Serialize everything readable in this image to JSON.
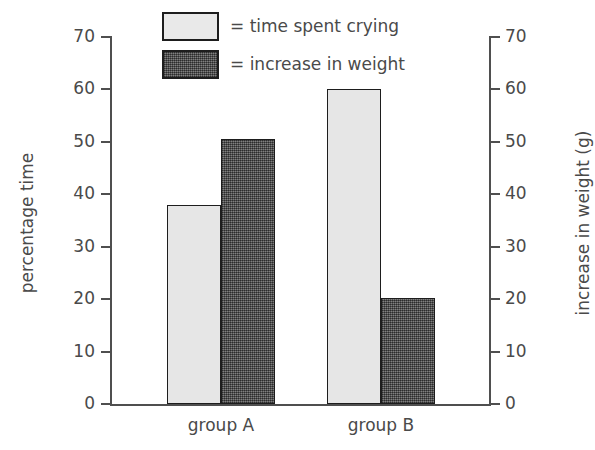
{
  "chart_data": {
    "type": "bar",
    "title": "",
    "categories": [
      "group A",
      "group B"
    ],
    "series": [
      {
        "name": "time spent crying",
        "legend_label": "= time spent crying",
        "axis": "left",
        "unit": "%",
        "color": "#e6e6e6",
        "fill_style": "light-solid",
        "values": [
          38,
          60
        ]
      },
      {
        "name": "increase in weight",
        "legend_label": "= increase in weight",
        "axis": "right",
        "unit": "g",
        "color": "#5a5a5a",
        "fill_style": "dark-stipple",
        "values": [
          50.5,
          20.3
        ]
      }
    ],
    "xlabel": "",
    "ylabel": "percentage time",
    "y2label": "increase in weight (g)",
    "ylim": [
      0,
      70
    ],
    "y2lim": [
      0,
      70
    ],
    "ytick_labels": [
      "0",
      "10",
      "20",
      "30",
      "40",
      "50",
      "60",
      "70"
    ],
    "ytick_values": [
      0,
      10,
      20,
      30,
      40,
      50,
      60,
      70
    ],
    "y2tick_labels": [
      "0",
      "10",
      "20",
      "30",
      "40",
      "50",
      "60",
      "70"
    ],
    "y2tick_values": [
      0,
      10,
      20,
      30,
      40,
      50,
      60,
      70
    ],
    "grid": false,
    "legend_position": "top-center"
  },
  "axes": {
    "left_title": "percentage time",
    "right_title": "increase in weight (g)"
  },
  "legend": {
    "items": [
      {
        "label": "= time spent crying"
      },
      {
        "label": "= increase in weight"
      }
    ]
  },
  "groups": [
    {
      "label": "group A"
    },
    {
      "label": "group B"
    }
  ]
}
